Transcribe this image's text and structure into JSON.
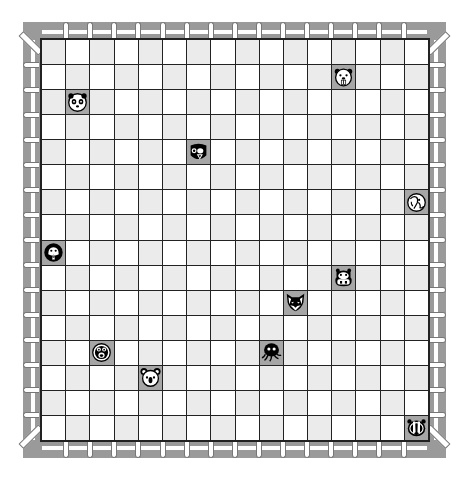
{
  "board": {
    "rows": 16,
    "cols": 16,
    "colors": {
      "light": "#ebebeb",
      "white": "#ffffff",
      "occupied": "#a6a6a6",
      "grid_line": "#222222",
      "fence": "#9a9a9a",
      "picket": "#ffffff"
    },
    "pieces": [
      {
        "name": "panda",
        "icon": "panda-icon",
        "row": 2,
        "col": 1
      },
      {
        "name": "beaver",
        "icon": "beaver-icon",
        "row": 1,
        "col": 12
      },
      {
        "name": "bear",
        "icon": "bear-icon",
        "row": 4,
        "col": 6
      },
      {
        "name": "elephant",
        "icon": "elephant-icon",
        "row": 6,
        "col": 15
      },
      {
        "name": "penguin",
        "icon": "penguin-icon",
        "row": 8,
        "col": 0
      },
      {
        "name": "hippo",
        "icon": "hippo-icon",
        "row": 9,
        "col": 12
      },
      {
        "name": "fox",
        "icon": "fox-icon",
        "row": 10,
        "col": 10
      },
      {
        "name": "octopus",
        "icon": "octopus-icon",
        "row": 12,
        "col": 9
      },
      {
        "name": "monkey",
        "icon": "monkey-icon",
        "row": 12,
        "col": 2
      },
      {
        "name": "koala",
        "icon": "koala-icon",
        "row": 13,
        "col": 4
      },
      {
        "name": "badger",
        "icon": "badger-icon",
        "row": 15,
        "col": 15
      }
    ]
  }
}
